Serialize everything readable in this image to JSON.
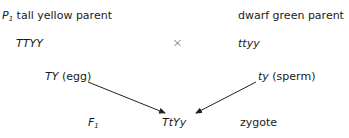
{
  "diagram": {
    "parent1": {
      "prefix": "P",
      "prefix_sub": "1",
      "label": "tall yellow parent",
      "genotype": "TTYY"
    },
    "parent2": {
      "label": "dwarf green parent",
      "genotype": "ttyy"
    },
    "cross_symbol": "×",
    "gamete1": {
      "allele": "TY",
      "label": "(egg)"
    },
    "gamete2": {
      "allele": "ty",
      "label": "(sperm)"
    },
    "generation": {
      "prefix": "F",
      "prefix_sub": "1"
    },
    "offspring": {
      "genotype": "TtYy",
      "label": "zygote"
    },
    "colors": {
      "text": "#1a1a1a",
      "arrow": "#222222",
      "cross": "#666666"
    }
  }
}
